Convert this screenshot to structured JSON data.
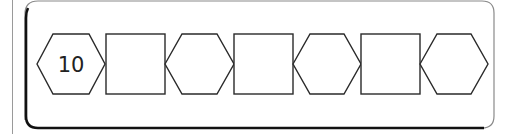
{
  "worksheet": {
    "sequence": [
      {
        "shape": "hexagon",
        "value": "10"
      },
      {
        "shape": "square",
        "value": ""
      },
      {
        "shape": "hexagon",
        "value": ""
      },
      {
        "shape": "square",
        "value": ""
      },
      {
        "shape": "hexagon",
        "value": ""
      },
      {
        "shape": "square",
        "value": ""
      },
      {
        "shape": "hexagon",
        "value": ""
      }
    ],
    "first_value": "10"
  },
  "colors": {
    "stroke": "#2a2a2a",
    "frame": "#111111",
    "frame_light": "#8a8a8a",
    "page_line": "#9a9a9a"
  }
}
